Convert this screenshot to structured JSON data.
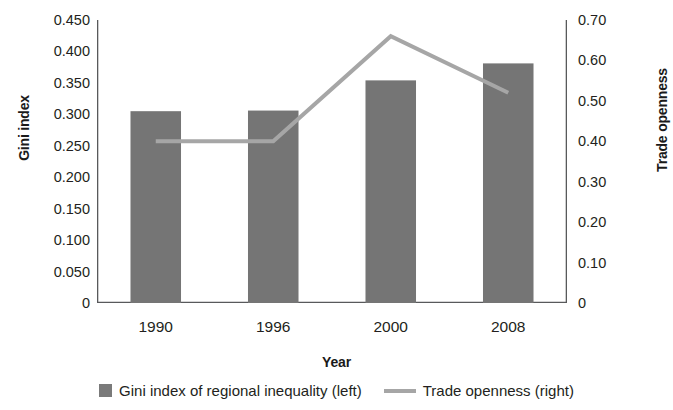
{
  "chart_data": {
    "type": "bar",
    "title": "",
    "categories": [
      "1990",
      "1996",
      "2000",
      "2008"
    ],
    "xlabel": "Year",
    "series": [
      {
        "name": "Gini index of regional inequality (left)",
        "type": "bar",
        "axis": "left",
        "color": "#757575",
        "values": [
          0.305,
          0.306,
          0.354,
          0.381
        ]
      },
      {
        "name": "Trade openness (right)",
        "type": "line",
        "axis": "right",
        "color": "#a6a6a6",
        "values": [
          0.4,
          0.4,
          0.66,
          0.52
        ]
      }
    ],
    "left_axis": {
      "label": "Gini index",
      "ylim": [
        0,
        0.45
      ],
      "ticks": [
        "0",
        "0.050",
        "0.100",
        "0.150",
        "0.200",
        "0.250",
        "0.300",
        "0.350",
        "0.400",
        "0.450"
      ],
      "tick_values": [
        0,
        0.05,
        0.1,
        0.15,
        0.2,
        0.25,
        0.3,
        0.35,
        0.4,
        0.45
      ]
    },
    "right_axis": {
      "label": "Trade openness",
      "ylim": [
        0,
        0.7
      ],
      "ticks": [
        "0",
        "0.10",
        "0.20",
        "0.30",
        "0.40",
        "0.50",
        "0.60",
        "0.70"
      ],
      "tick_values": [
        0,
        0.1,
        0.2,
        0.3,
        0.4,
        0.5,
        0.6,
        0.7
      ]
    },
    "grid": false,
    "legend_position": "bottom"
  },
  "axes": {
    "y_left_title": "Gini index",
    "y_right_title": "Trade openness",
    "x_title": "Year"
  },
  "legend": {
    "items": [
      {
        "label": "Gini index of regional inequality (left)",
        "marker": "square-swatch-icon"
      },
      {
        "label": "Trade openness (right)",
        "marker": "line-swatch-icon"
      }
    ]
  }
}
